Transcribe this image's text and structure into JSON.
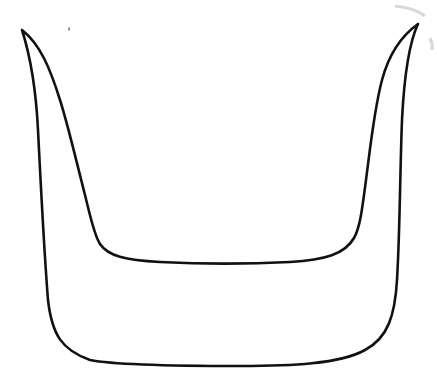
{
  "image": {
    "description": "Black line drawing of a U-shaped outline with pointed horn-like tips at the top left and top right corners",
    "background_color": "#ffffff",
    "stroke_color": "#111111",
    "width": 437,
    "height": 391
  },
  "shape": {
    "name": "u-shaped-horned-outline",
    "left_tip": [
      22,
      30
    ],
    "right_tip": [
      418,
      24
    ]
  }
}
